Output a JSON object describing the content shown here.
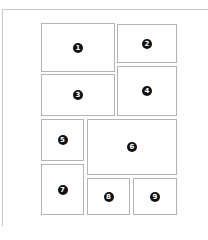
{
  "diagram": {
    "type": "page-layout-grid",
    "panels": [
      {
        "label": "1",
        "x": 41,
        "y": 23,
        "w": 74,
        "h": 49
      },
      {
        "label": "2",
        "x": 117,
        "y": 24,
        "w": 60,
        "h": 39
      },
      {
        "label": "3",
        "x": 41,
        "y": 74,
        "w": 74,
        "h": 42
      },
      {
        "label": "4",
        "x": 117,
        "y": 66,
        "w": 60,
        "h": 50
      },
      {
        "label": "5",
        "x": 41,
        "y": 119,
        "w": 43,
        "h": 42
      },
      {
        "label": "6",
        "x": 87,
        "y": 119,
        "w": 90,
        "h": 56
      },
      {
        "label": "7",
        "x": 41,
        "y": 164,
        "w": 43,
        "h": 51
      },
      {
        "label": "8",
        "x": 87,
        "y": 178,
        "w": 43,
        "h": 37
      },
      {
        "label": "9",
        "x": 133,
        "y": 178,
        "w": 44,
        "h": 37
      }
    ]
  }
}
